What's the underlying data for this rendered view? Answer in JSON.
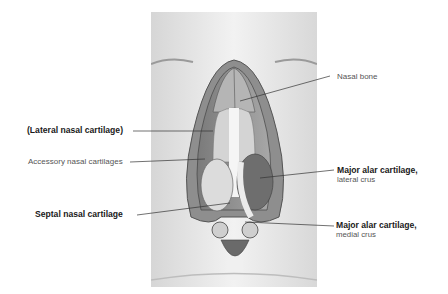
{
  "figure": {
    "background": "#e9e9e9"
  },
  "labels": {
    "nasal_bone": {
      "text": "Nasal bone",
      "weight": "regular"
    },
    "lateral_nasal_cartilage": {
      "text": "(Lateral nasal cartilage)",
      "weight": "bold"
    },
    "accessory_nasal_cartilages": {
      "text": "Accessory nasal cartilages",
      "weight": "regular"
    },
    "major_alar_lateral": {
      "text": "Major alar cartilage,",
      "sub": "lateral crus",
      "weight": "bold"
    },
    "septal_nasal_cartilage": {
      "text": "Septal nasal cartilage",
      "weight": "bold"
    },
    "major_alar_medial": {
      "text": "Major alar cartilage,",
      "sub": "medial crus",
      "weight": "bold"
    }
  },
  "colors": {
    "leader_line": "#333333",
    "label_bold": "#1a1a1a",
    "label_regular": "#555555"
  }
}
